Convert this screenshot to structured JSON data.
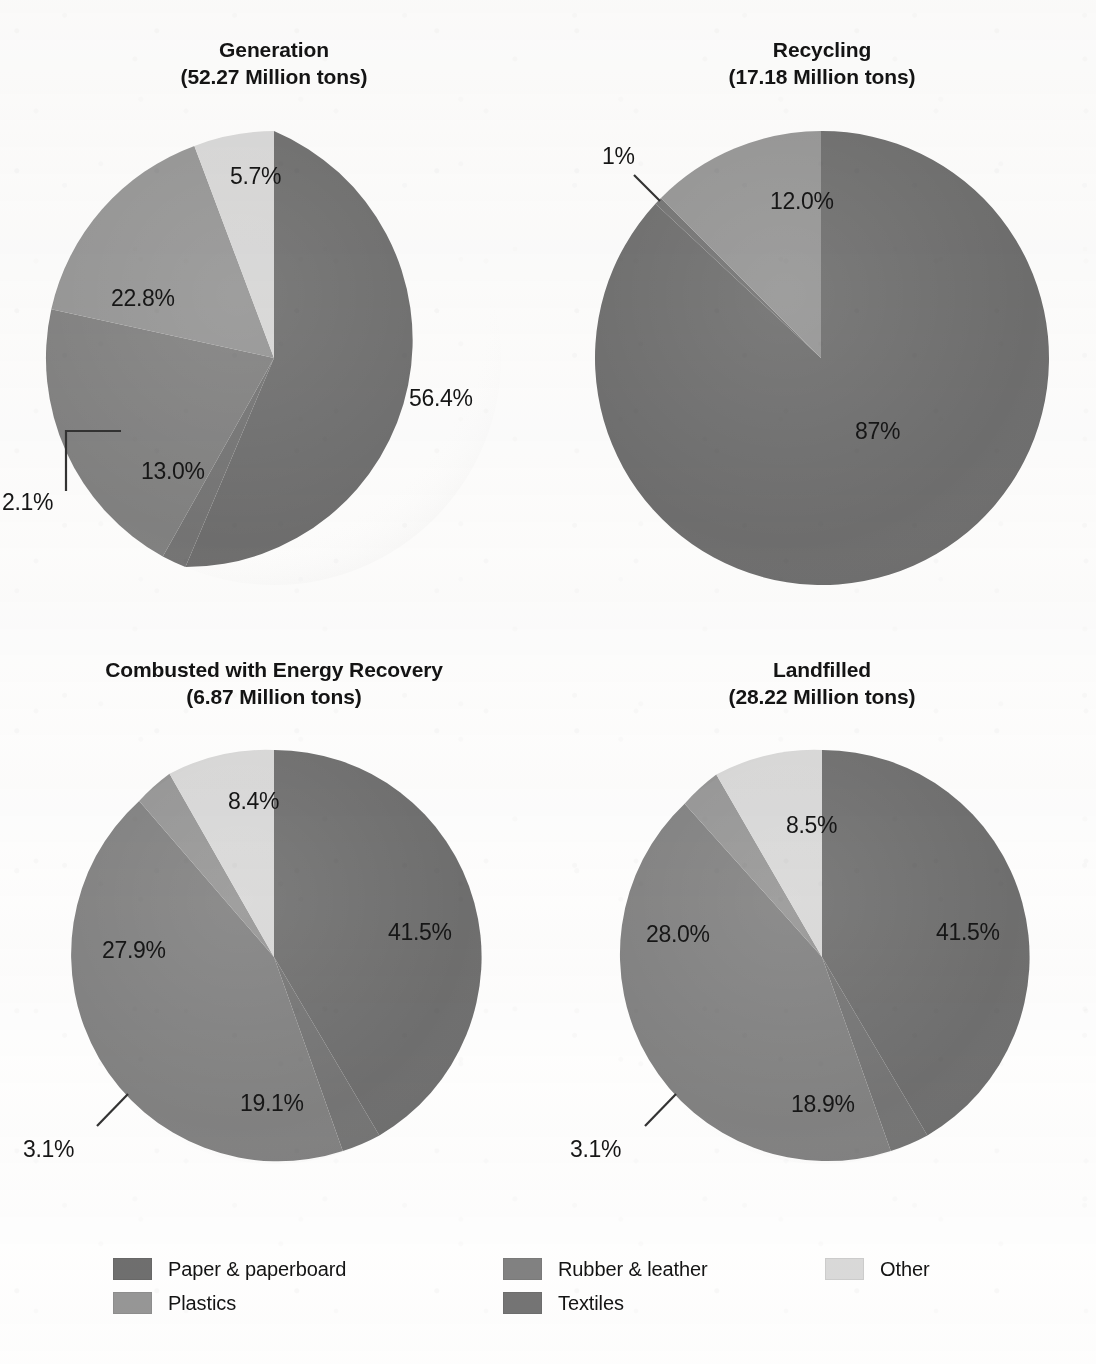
{
  "figure": {
    "clipped_top_title": "",
    "legend_position": "bottom"
  },
  "legend": {
    "columns": [
      {
        "left": 0,
        "items": [
          {
            "label": "Paper & paperboard",
            "color": "#6f6f6f",
            "name": "paper-paperboard"
          },
          {
            "label": "Plastics",
            "color": "#979797",
            "name": "plastics"
          }
        ]
      },
      {
        "left": 390,
        "items": [
          {
            "label": "Rubber & leather",
            "color": "#828282",
            "name": "rubber-leather"
          },
          {
            "label": "Textiles",
            "color": "#757575",
            "name": "textiles"
          }
        ]
      },
      {
        "left": 712,
        "items": [
          {
            "label": "Other",
            "color": "#dadada",
            "name": "other"
          }
        ]
      }
    ]
  },
  "chart_data": {
    "type": "pie",
    "title": "",
    "legend": [
      "Paper & paperboard",
      "Plastics",
      "Rubber & leather",
      "Textiles",
      "Other"
    ],
    "legend_position": "bottom",
    "units": "percent",
    "colors": {
      "Paper & paperboard": "#6f6f6f",
      "Plastics": "#979797",
      "Rubber & leather": "#828282",
      "Textiles": "#757575",
      "Other": "#dadada"
    },
    "panels": [
      {
        "name": "generation",
        "title": "Generation",
        "subtitle": "(52.27 Million tons)",
        "total_million_tons": 52.27,
        "categories": [
          "Paper & paperboard",
          "Textiles",
          "Rubber & leather",
          "Plastics",
          "Other"
        ],
        "values": [
          56.4,
          2.1,
          13.0,
          22.8,
          5.7
        ],
        "labels": [
          "56.4%",
          "2.1%",
          "13.0%",
          "22.8%",
          "5.7%"
        ]
      },
      {
        "name": "recycling",
        "title": "Recycling",
        "subtitle": "(17.18 Million tons)",
        "total_million_tons": 17.18,
        "categories": [
          "Paper & paperboard",
          "Textiles",
          "Plastics"
        ],
        "values": [
          87,
          1,
          12.0
        ],
        "labels": [
          "87%",
          "1%",
          "12.0%"
        ]
      },
      {
        "name": "combusted-with-energy-recovery",
        "title": "Combusted with Energy Recovery",
        "subtitle": "(6.87 Million tons)",
        "total_million_tons": 6.87,
        "categories": [
          "Paper & paperboard",
          "Textiles",
          "Rubber & leather",
          "Plastics",
          "Other"
        ],
        "values": [
          41.5,
          3.1,
          19.1,
          27.9,
          8.4
        ],
        "labels": [
          "41.5%",
          "3.1%",
          "19.1%",
          "27.9%",
          "8.4%"
        ]
      },
      {
        "name": "landfilled",
        "title": "Landfilled",
        "subtitle": "(28.22 Million tons)",
        "total_million_tons": 28.22,
        "categories": [
          "Paper & paperboard",
          "Textiles",
          "Rubber & leather",
          "Plastics",
          "Other"
        ],
        "values": [
          41.5,
          3.1,
          18.9,
          28.0,
          8.5
        ],
        "labels": [
          "41.5%",
          "3.1%",
          "18.9%",
          "28.0%",
          "8.5%"
        ]
      }
    ]
  },
  "panels": {
    "generation": {
      "title": "Generation",
      "subtitle": "(52.27 Million tons)",
      "slices": {
        "paper": "56.4%",
        "rubber": "13.0%",
        "textiles": "2.1%",
        "plastics": "22.8%",
        "other": "5.7%"
      }
    },
    "recycling": {
      "title": "Recycling",
      "subtitle": "(17.18 Million tons)",
      "slices": {
        "paper": "87%",
        "textiles": "1%",
        "plastics": "12.0%"
      }
    },
    "combusted": {
      "title": "Combusted with Energy Recovery",
      "subtitle": "(6.87 Million tons)",
      "slices": {
        "paper": "41.5%",
        "rubber": "19.1%",
        "textiles": "3.1%",
        "plastics": "27.9%",
        "other": "8.4%"
      }
    },
    "landfilled": {
      "title": "Landfilled",
      "subtitle": "(28.22 Million tons)",
      "slices": {
        "paper": "41.5%",
        "rubber": "18.9%",
        "textiles": "3.1%",
        "plastics": "28.0%",
        "other": "8.5%"
      }
    }
  }
}
